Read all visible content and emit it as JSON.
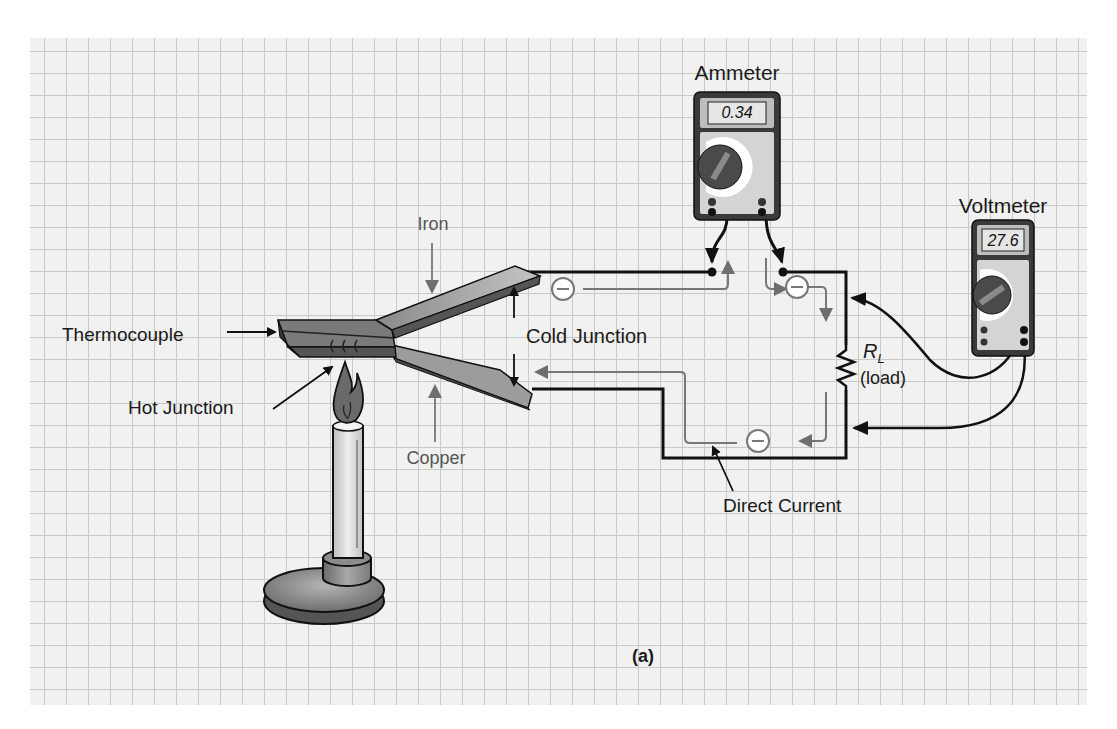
{
  "figure": {
    "caption": "(a)",
    "labels": {
      "ammeter": "Ammeter",
      "voltmeter": "Voltmeter",
      "iron": "Iron",
      "copper": "Copper",
      "thermocouple": "Thermocouple",
      "hot_junction": "Hot Junction",
      "cold_junction": "Cold Junction",
      "load_symbol": "R",
      "load_subscript": "L",
      "load_text": "(load)",
      "direct_current": "Direct Current"
    },
    "ammeter": {
      "reading": "0.34",
      "dial_labels": [
        "OFF",
        "V~",
        "V⎓",
        "300 mV⎓",
        "Ω",
        "→|",
        "A⎓",
        "A~"
      ],
      "jacks": [
        "10 A",
        "V Ω",
        "300 mA",
        "COM"
      ]
    },
    "voltmeter": {
      "reading": "27.6",
      "dial_labels": [
        "OFF",
        "V~",
        "V⎓",
        "300 mV⎓",
        "Ω",
        "→|",
        "A⎓",
        "A~"
      ],
      "jacks": [
        "10 A",
        "V Ω",
        "300 mA",
        "COM"
      ]
    },
    "electron_symbol": "−",
    "colors": {
      "grid_bg": "#f1f1f1",
      "grid_line": "#c8c8c8",
      "wire": "#111111",
      "electron_path": "#777777",
      "metal_top": "#a8a8a8",
      "metal_side": "#555555",
      "meter_body": "#3a3a3a",
      "meter_face": "#d4d4d4",
      "display": "#e6e6e6"
    }
  }
}
